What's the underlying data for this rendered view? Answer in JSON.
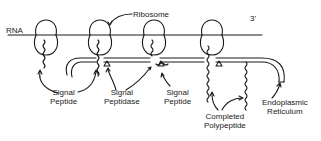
{
  "diagram": {
    "colors": {
      "ink": "#1a1a1a",
      "background": "#ffffff"
    },
    "labels": {
      "rna": "RNA",
      "three_prime": "3'",
      "ribosome": "Ribosome",
      "signal_peptide_1": [
        "Signal",
        "Peptide"
      ],
      "signal_peptidase": [
        "Signal",
        "Peptidase"
      ],
      "signal_peptide_2": [
        "Signal",
        "Peptide"
      ],
      "completed_polypeptide": [
        "Completed",
        "Polypeptide"
      ],
      "endoplasmic_reticulum": [
        "Endoplasmic",
        "Reticulum"
      ]
    }
  }
}
